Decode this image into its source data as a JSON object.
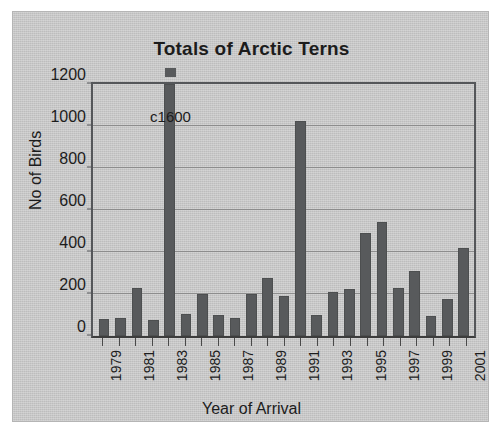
{
  "chart_data": {
    "type": "bar",
    "title": "Totals of Arctic Terns",
    "xlabel": "Year of Arrival",
    "ylabel": "No of Birds",
    "ylim": [
      0,
      1200
    ],
    "yticks": [
      0,
      200,
      400,
      600,
      800,
      1000,
      1200
    ],
    "ytick_labels": [
      "0",
      "200",
      "400",
      "600",
      "800",
      "1000",
      "1200"
    ],
    "grid": true,
    "legend": "none",
    "categories": [
      "1979",
      "1980",
      "1981",
      "1982",
      "1983",
      "1984",
      "1985",
      "1986",
      "1987",
      "1988",
      "1989",
      "1990",
      "1991",
      "1992",
      "1993",
      "1994",
      "1995",
      "1996",
      "1997",
      "1998",
      "1999",
      "2000",
      "2001"
    ],
    "xtick_labels_shown": [
      "1979",
      "1981",
      "1983",
      "1985",
      "1987",
      "1989",
      "1991",
      "1993",
      "1995",
      "1997",
      "1999",
      "2001"
    ],
    "values": [
      80,
      85,
      230,
      75,
      1600,
      105,
      200,
      100,
      85,
      200,
      275,
      190,
      1025,
      100,
      210,
      225,
      490,
      545,
      230,
      310,
      95,
      175,
      420
    ],
    "annotations": [
      {
        "text": "c1600",
        "category": "1983",
        "note": "bar clipped at axis maximum; value written above truncated bar"
      }
    ],
    "bar_color": "#585a5c",
    "plot_background": "#c9c9c9",
    "gridline_color": "#8d8d8d",
    "axis_color": "#55575a",
    "text_color": "#1c1c1c"
  }
}
